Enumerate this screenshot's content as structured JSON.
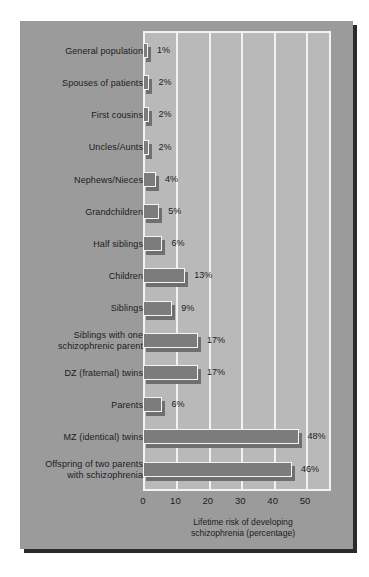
{
  "chart_data": {
    "type": "bar",
    "orientation": "horizontal",
    "title": "",
    "xlabel": "Lifetime risk of developing\nschizophrenia (percentage)",
    "ylabel": "",
    "xlim": [
      0,
      58
    ],
    "xticks": [
      0,
      10,
      20,
      30,
      40,
      50
    ],
    "xtick_labels": [
      "0",
      "10",
      "20",
      "30",
      "40",
      "50"
    ],
    "grid": true,
    "legend": null,
    "categories": [
      "General population",
      "Spouses of patients",
      "First cousins",
      "Uncles/Aunts",
      "Nephews/Nieces",
      "Grandchildren",
      "Half siblings",
      "Children",
      "Siblings",
      "Siblings with one\nschizophrenic parent",
      "DZ (fraternal) twins",
      "Parents",
      "MZ (identical) twins",
      "Offspring of two parents\nwith schizophrenia"
    ],
    "values": [
      1,
      2,
      2,
      2,
      4,
      5,
      6,
      13,
      9,
      17,
      17,
      6,
      48,
      46
    ],
    "value_labels": [
      "1%",
      "2%",
      "2%",
      "2%",
      "4%",
      "5%",
      "6%",
      "13%",
      "9%",
      "17%",
      "17%",
      "6%",
      "48%",
      "46%"
    ]
  },
  "style": {
    "page_background": "#ffffff",
    "panel_background": "#9b9b9b",
    "panel_shadow": "#2b2b2b",
    "plot_background": "#b9b9b9",
    "gridline_color": "#f2f2f2",
    "bar_fill": "#7c7c7c",
    "bar_border": "#f4f4f4",
    "bar_shadow": "#6f6f6f",
    "text_color": "#1c1c1c"
  }
}
